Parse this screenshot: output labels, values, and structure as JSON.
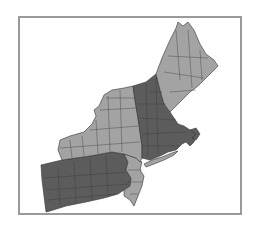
{
  "map": {
    "title": "",
    "region": "Northeastern United States",
    "frame": {
      "stroke": "#9a9a9a",
      "fill": "#ffffff"
    },
    "colors": {
      "light_group": "#a3a3a3",
      "dark_group": "#5c5c5c",
      "borders": "#3a3a3a"
    },
    "groups": [
      {
        "name": "light",
        "states": [
          "Maine",
          "New York",
          "New Jersey"
        ],
        "color": "#a3a3a3"
      },
      {
        "name": "dark",
        "states": [
          "Pennsylvania",
          "Vermont",
          "New Hampshire",
          "Massachusetts",
          "Connecticut",
          "Rhode Island"
        ],
        "color": "#5c5c5c"
      }
    ]
  }
}
